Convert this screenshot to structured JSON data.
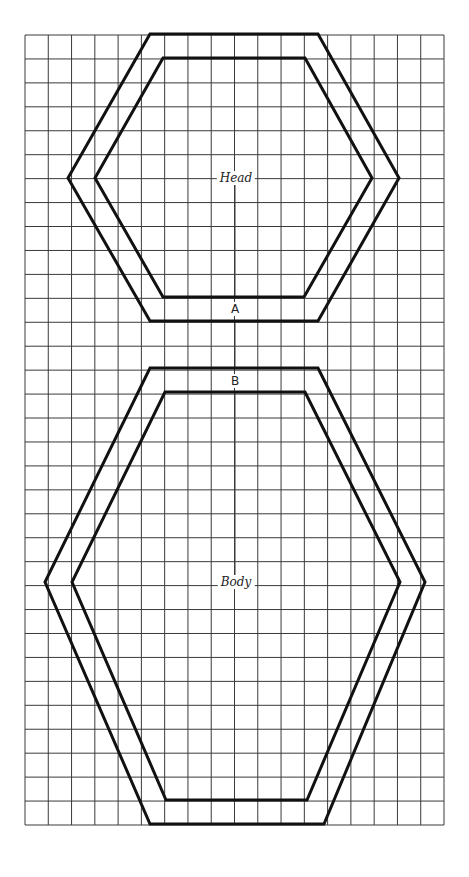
{
  "diagram": {
    "type": "pattern-template",
    "grid": {
      "x0": 25,
      "y0": 35,
      "x1": 444,
      "y1": 825,
      "columns": 18,
      "rows": 33,
      "line_color": "#3a3a3a"
    },
    "pieces": [
      {
        "name": "Head",
        "label": "Head",
        "label_pos": [
          236,
          178
        ],
        "outer": [
          [
            150,
            34
          ],
          [
            318,
            34
          ],
          [
            399,
            178
          ],
          [
            318,
            321
          ],
          [
            150,
            321
          ],
          [
            68,
            178
          ]
        ],
        "inner": [
          [
            163,
            58
          ],
          [
            305,
            58
          ],
          [
            372,
            178
          ],
          [
            304,
            297
          ],
          [
            163,
            297
          ],
          [
            95,
            178
          ]
        ]
      },
      {
        "name": "Body",
        "label": "Body",
        "label_pos": [
          236,
          582
        ],
        "outer": [
          [
            150,
            368
          ],
          [
            318,
            368
          ],
          [
            425,
            582
          ],
          [
            324,
            824
          ],
          [
            150,
            824
          ],
          [
            45,
            582
          ]
        ],
        "inner": [
          [
            165,
            392
          ],
          [
            305,
            392
          ],
          [
            400,
            582
          ],
          [
            307,
            800
          ],
          [
            166,
            800
          ],
          [
            72,
            582
          ]
        ]
      }
    ],
    "markers": [
      {
        "label": "A",
        "pos": [
          235,
          309
        ]
      },
      {
        "label": "B",
        "pos": [
          235,
          381
        ]
      }
    ],
    "center_line": {
      "x": 235,
      "segments": [
        [
          178,
          297
        ],
        [
          321,
          368
        ],
        [
          392,
          582
        ]
      ]
    },
    "outline_color": "#111111"
  }
}
